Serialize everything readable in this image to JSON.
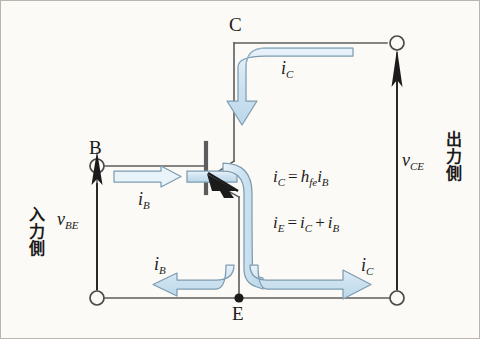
{
  "diagram": {
    "colors": {
      "background": "#fbfaf6",
      "wire": "#5c5c5c",
      "ink": "#1b1b1b",
      "flow_fill": "#cfe3f1",
      "flow_fill_light": "#e6f1f8",
      "flow_stroke": "#7e9cb0"
    },
    "terminals": [
      {
        "id": "C",
        "label": "C",
        "node_type": "open-circle"
      },
      {
        "id": "B",
        "label": "B",
        "node_type": "open-circle"
      },
      {
        "id": "E",
        "label": "E",
        "node_type": "filled-dot"
      }
    ],
    "voltages": [
      {
        "id": "vBE",
        "base": "v",
        "sub": "BE",
        "side_label": "入力側"
      },
      {
        "id": "vCE",
        "base": "v",
        "sub": "CE",
        "side_label": "出力側"
      }
    ],
    "currents": [
      {
        "id": "iC-top",
        "base": "i",
        "sub": "C"
      },
      {
        "id": "iB-in",
        "base": "i",
        "sub": "B"
      },
      {
        "id": "iB-out",
        "base": "i",
        "sub": "B"
      },
      {
        "id": "iC-bottom",
        "base": "i",
        "sub": "C"
      }
    ],
    "equations": [
      {
        "id": "eq-ic",
        "lhs_base": "i",
        "lhs_sub": "C",
        "op": "=",
        "gain_base": "h",
        "gain_sub": "fe",
        "rhs_base": "i",
        "rhs_sub": "B"
      },
      {
        "id": "eq-ie",
        "lhs_base": "i",
        "lhs_sub": "E",
        "op": "=",
        "t1_base": "i",
        "t1_sub": "C",
        "plus": "+",
        "t2_base": "i",
        "t2_sub": "B"
      }
    ],
    "sides": {
      "input": "入力側",
      "output": "出力側"
    }
  }
}
